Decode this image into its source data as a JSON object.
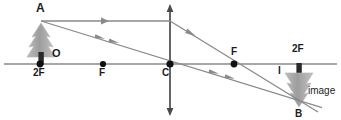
{
  "figure": {
    "type": "optics-ray-diagram",
    "width": 341,
    "height": 120,
    "background": "#ffffff"
  },
  "colors": {
    "axis": "#8a8a8a",
    "ray": "#8a8a8a",
    "lens": "#4a4a4a",
    "point": "#111111",
    "label": "#1c1c1c",
    "foliage": "#a8a8a8",
    "trunk": "#2a2a2a"
  },
  "labels": {
    "object_tip": "A",
    "object": "O",
    "focal_left": "F",
    "double_focal_left": "2F",
    "center": "C",
    "focal_right": "F",
    "double_focal_right": "2F",
    "image_marker": "I",
    "image_tip": "B",
    "image_word": "image"
  },
  "geometry": {
    "axis": {
      "x1": 4,
      "y1": 64,
      "x2": 337,
      "y2": 64
    },
    "lens": {
      "x": 170,
      "y_top": 6,
      "y_bottom": 114
    },
    "points": [
      {
        "name": "2F-left",
        "x": 40,
        "y": 64
      },
      {
        "name": "F-left",
        "x": 103,
        "y": 64
      },
      {
        "name": "C",
        "x": 170,
        "y": 64
      },
      {
        "name": "F-right",
        "x": 234,
        "y": 64
      },
      {
        "name": "2F-right",
        "x": 299,
        "y": 64
      }
    ],
    "object_tip": {
      "x": 41,
      "y": 21
    },
    "image_tip": {
      "x": 297,
      "y": 105
    },
    "object_tree": {
      "base_x": 41,
      "base_y": 64,
      "top_y": 22,
      "width": 26
    },
    "image_tree": {
      "base_x": 299,
      "base_y": 64,
      "tip_y": 108,
      "width": 26
    }
  },
  "rays": [
    {
      "name": "parallel-ray-incident",
      "description": "from object tip A parallel to axis to lens",
      "x1": 41,
      "y1": 21,
      "x2": 170,
      "y2": 21,
      "arrows": [
        {
          "x": 105,
          "y": 21,
          "angle": 0
        }
      ]
    },
    {
      "name": "parallel-ray-refracted",
      "description": "refracted through focal point F to image tip B",
      "x1": 170,
      "y1": 21,
      "x2": 316,
      "y2": 111,
      "arrows": [
        {
          "x": 192,
          "y": 34,
          "angle": 31.6
        }
      ]
    },
    {
      "name": "center-ray",
      "description": "from object tip A straight through lens centre C to image tip B",
      "x1": 41,
      "y1": 21,
      "x2": 320,
      "y2": 107,
      "arrows": [
        {
          "x": 101,
          "y": 39,
          "angle": 17.1
        },
        {
          "x": 115,
          "y": 43,
          "angle": 17.1
        },
        {
          "x": 215,
          "y": 74,
          "angle": 17.1
        },
        {
          "x": 231,
          "y": 79,
          "angle": 17.1
        }
      ]
    }
  ]
}
